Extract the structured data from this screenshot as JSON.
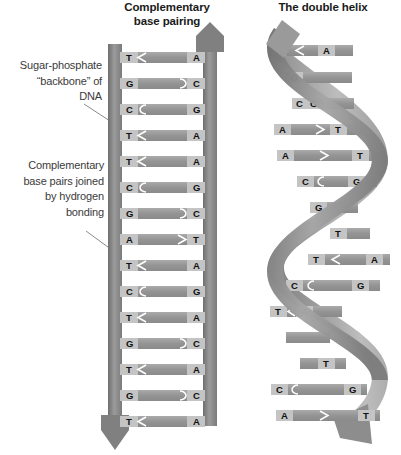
{
  "figure": {
    "background": "#ffffff",
    "backbone_color": "#8e8e8e",
    "backbone_dark": "#777777",
    "rung_color": "#9a9a9a",
    "base_box_color": "#c9c9c9",
    "text_color": "#111111",
    "leader_color": "#8a8a8a"
  },
  "panels": {
    "ladder": {
      "title": "Complementary\nbase pairing",
      "title_line1": "Complementary",
      "title_line2": "base pairing",
      "strand_left_direction": "down",
      "strand_right_direction": "up",
      "base_pairs": [
        {
          "left": "T",
          "right": "A",
          "bonds": 2
        },
        {
          "left": "G",
          "right": "C",
          "bonds": 3
        },
        {
          "left": "C",
          "right": "G",
          "bonds": 3
        },
        {
          "left": "T",
          "right": "A",
          "bonds": 2
        },
        {
          "left": "T",
          "right": "A",
          "bonds": 2
        },
        {
          "left": "C",
          "right": "G",
          "bonds": 3
        },
        {
          "left": "G",
          "right": "C",
          "bonds": 3
        },
        {
          "left": "A",
          "right": "T",
          "bonds": 2
        },
        {
          "left": "T",
          "right": "A",
          "bonds": 2
        },
        {
          "left": "C",
          "right": "G",
          "bonds": 3
        },
        {
          "left": "T",
          "right": "A",
          "bonds": 2
        },
        {
          "left": "G",
          "right": "C",
          "bonds": 3
        },
        {
          "left": "T",
          "right": "A",
          "bonds": 2
        },
        {
          "left": "G",
          "right": "C",
          "bonds": 3
        },
        {
          "left": "T",
          "right": "A",
          "bonds": 2
        }
      ]
    },
    "helix": {
      "title": "The double helix",
      "strand_left_direction": "up",
      "strand_right_direction": "down",
      "base_pairs": [
        {
          "left": "T",
          "right": "A"
        },
        {
          "left": "G",
          "right": "C"
        },
        {
          "left": "C",
          "right": "G"
        },
        {
          "left": "A",
          "right": "T"
        },
        {
          "left": "A",
          "right": "T"
        },
        {
          "left": "C",
          "right": "G"
        },
        {
          "left": "G",
          "right": "C"
        },
        {
          "left": "T",
          "right": "A"
        },
        {
          "left": "T",
          "right": "A"
        },
        {
          "left": "C",
          "right": "G"
        },
        {
          "left": "T",
          "right": "A"
        },
        {
          "left": "A",
          "right": "T"
        },
        {
          "left": "T",
          "right": "A"
        },
        {
          "left": "C",
          "right": "G"
        },
        {
          "left": "A",
          "right": "T"
        }
      ]
    }
  },
  "annotations": [
    {
      "id": "backbone",
      "text": "Sugar-phosphate\n“backbone” of\nDNA",
      "line1": "Sugar-phosphate",
      "line2": "“backbone” of",
      "line3": "DNA",
      "points_to": "sugar-phosphate backbone strand"
    },
    {
      "id": "bonding",
      "text": "Complementary\nbase pairs joined\nby hydrogen\nbonding",
      "line1": "Complementary",
      "line2": "base pairs joined",
      "line3": "by hydrogen",
      "line4": "bonding",
      "points_to": "hydrogen-bonded base pair rung"
    }
  ]
}
